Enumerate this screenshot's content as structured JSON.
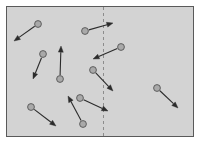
{
  "figure": {
    "title": "",
    "caption": "",
    "type": "vector-field-diagram",
    "canvas": {
      "width": 201,
      "height": 144
    }
  },
  "colors": {
    "page_background": "#ffffff",
    "panel_fill": "#d3d3d3",
    "panel_border": "#5a5a5a",
    "divider": "#8c8c8c",
    "node_fill": "#a9a9a9",
    "node_stroke": "#555555",
    "arrow": "#2b2b2b"
  },
  "panel": {
    "label": "field-region",
    "x": 6,
    "y": 6,
    "width": 188,
    "height": 131,
    "border_width": 1
  },
  "divider": {
    "label": "boundary-line",
    "orientation": "vertical",
    "x": 103.5,
    "y1": 7,
    "y2": 136,
    "style": "dashed",
    "dash": "3 3",
    "width": 1
  },
  "node_radius": 3.4,
  "arrow_width": 1.1,
  "arrow_head_length": 6.2,
  "arrow_head_width": 5.0,
  "vectors": [
    {
      "id": "v1",
      "name": "vector-top-left",
      "x1": 38,
      "y1": 24,
      "x2": 14,
      "y2": 41,
      "crosses_divider": false
    },
    {
      "id": "v2",
      "name": "vector-left-mid",
      "x1": 43,
      "y1": 54,
      "x2": 33,
      "y2": 79,
      "crosses_divider": false
    },
    {
      "id": "v3",
      "name": "vector-center-up",
      "x1": 60,
      "y1": 79,
      "x2": 61,
      "y2": 46,
      "crosses_divider": false
    },
    {
      "id": "v4",
      "name": "vector-top-center-right",
      "x1": 85,
      "y1": 31,
      "x2": 113,
      "y2": 23,
      "crosses_divider": true
    },
    {
      "id": "v5",
      "name": "vector-upper-right-left",
      "x1": 121,
      "y1": 47,
      "x2": 93,
      "y2": 59,
      "crosses_divider": true
    },
    {
      "id": "v6",
      "name": "vector-center-down-right",
      "x1": 93,
      "y1": 70,
      "x2": 113,
      "y2": 91,
      "crosses_divider": true
    },
    {
      "id": "v7",
      "name": "vector-far-right",
      "x1": 157,
      "y1": 88,
      "x2": 178,
      "y2": 108,
      "crosses_divider": false
    },
    {
      "id": "v8",
      "name": "vector-bottom-left",
      "x1": 31,
      "y1": 107,
      "x2": 56,
      "y2": 126,
      "crosses_divider": false
    },
    {
      "id": "v9",
      "name": "vector-bottom-center-up",
      "x1": 83,
      "y1": 124,
      "x2": 68,
      "y2": 96,
      "crosses_divider": false
    },
    {
      "id": "v10",
      "name": "vector-bottom-center-right",
      "x1": 80,
      "y1": 98,
      "x2": 108,
      "y2": 111,
      "crosses_divider": true
    }
  ]
}
